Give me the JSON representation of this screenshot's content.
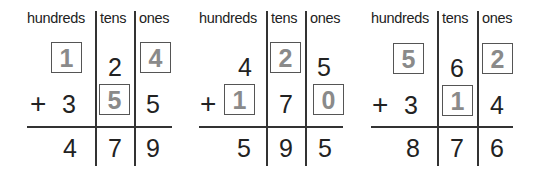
{
  "columns": {
    "hundreds": "hundreds",
    "tens": "tens",
    "ones": "ones"
  },
  "problems": [
    {
      "top": {
        "hundreds": "1",
        "tens": "2",
        "ones": "4"
      },
      "operator": "+",
      "bottom": {
        "hundreds": "3",
        "tens": "5",
        "ones": "5"
      },
      "sum": {
        "hundreds": "4",
        "tens": "7",
        "ones": "9"
      },
      "missing": [
        "top.hundreds",
        "top.ones",
        "bottom.tens"
      ]
    },
    {
      "top": {
        "hundreds": "4",
        "tens": "2",
        "ones": "5"
      },
      "operator": "+",
      "bottom": {
        "hundreds": "1",
        "tens": "7",
        "ones": "0"
      },
      "sum": {
        "hundreds": "5",
        "tens": "9",
        "ones": "5"
      },
      "missing": [
        "top.tens",
        "bottom.hundreds",
        "bottom.ones"
      ]
    },
    {
      "top": {
        "hundreds": "5",
        "tens": "6",
        "ones": "2"
      },
      "operator": "+",
      "bottom": {
        "hundreds": "3",
        "tens": "1",
        "ones": "4"
      },
      "sum": {
        "hundreds": "8",
        "tens": "7",
        "ones": "6"
      },
      "missing": [
        "top.hundreds",
        "top.ones",
        "bottom.tens"
      ]
    }
  ]
}
